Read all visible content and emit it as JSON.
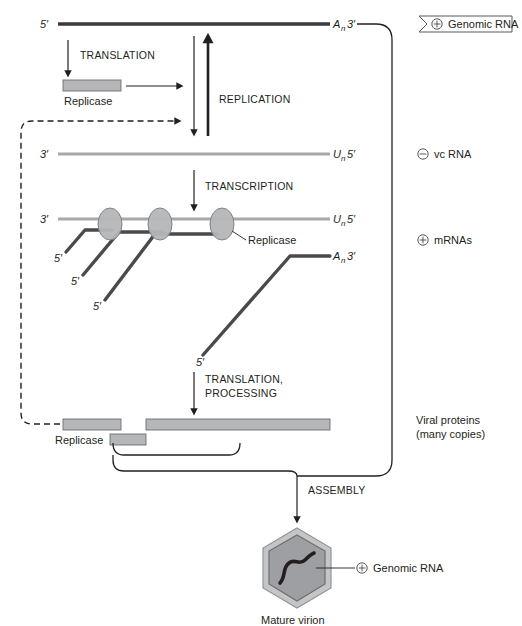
{
  "figure": {
    "colors": {
      "plus_strand": "#3b3b3d",
      "minus_strand": "#a6a8ab",
      "mrna": "#4a4a4c",
      "protein_fill": "#b4b6b8",
      "capsid_fill": "#c3c5c7",
      "capsid_inner": "#9d9fa2",
      "outline": "#231f20"
    }
  },
  "genomic_rna": {
    "five_prime": "5′",
    "poly_a": "A",
    "poly_a_sub": "n",
    "three_prime": "3′",
    "side_label": "Genomic RNA",
    "polarity": "+"
  },
  "vc_rna": {
    "three_prime": "3′",
    "poly_u": "U",
    "poly_u_sub": "n",
    "five_prime": "5′",
    "side_label": "vc RNA",
    "polarity": "−"
  },
  "mrna_row": {
    "three_prime": "3′",
    "poly_u": "U",
    "poly_u_sub": "n",
    "five_prime": "5′",
    "poly_a": "A",
    "poly_a_sub": "n",
    "three_prime_right": "3′",
    "side_label": "mRNAs",
    "polarity": "+",
    "replicase_callout": "Replicase",
    "transcript_five_primes": [
      "5′",
      "5′",
      "5′",
      "5′"
    ]
  },
  "processes": {
    "translation": "TRANSLATION",
    "replication": "REPLICATION",
    "transcription": "TRANSCRIPTION",
    "translation_processing_line1": "TRANSLATION,",
    "translation_processing_line2": "PROCESSING",
    "assembly": "ASSEMBLY"
  },
  "replicase_protein": {
    "label": "Replicase"
  },
  "viral_proteins": {
    "line1": "Viral proteins",
    "line2": "(many copies)"
  },
  "virion": {
    "label": "Mature virion",
    "rna_label": "Genomic RNA",
    "polarity": "+"
  },
  "icons": {
    "plus_circle": "plus-circle-icon",
    "minus_circle": "minus-circle-icon",
    "banner_arrow": "banner-arrow-icon",
    "hexagon_capsid": "hexagon-capsid-icon",
    "replicase_oval": "replicase-oval-icon",
    "arrow_down": "arrow-down-icon",
    "arrow_up": "arrow-up-icon",
    "arrow_right": "arrow-right-icon",
    "dashed_feedback": "dashed-feedback-arrow-icon",
    "brace": "brace-connector-icon"
  }
}
